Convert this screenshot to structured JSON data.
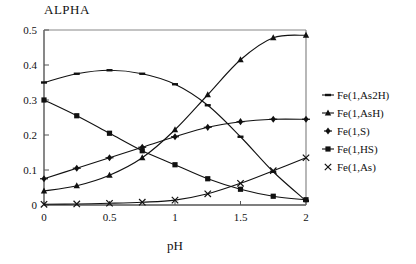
{
  "chart_data": {
    "type": "line",
    "title": "ALPHA",
    "xlabel": "pH",
    "ylabel": "",
    "xlim": [
      0,
      2
    ],
    "ylim": [
      0,
      0.5
    ],
    "xticks": [
      "0",
      "0.5",
      "1",
      "1.5",
      "2"
    ],
    "xtick_values": [
      0,
      0.5,
      1,
      1.5,
      2
    ],
    "yticks": [
      "0",
      "0.1",
      "0.2",
      "0.3",
      "0.4",
      "0.5"
    ],
    "ytick_values": [
      0,
      0.1,
      0.2,
      0.3,
      0.4,
      0.5
    ],
    "grid": false,
    "legend_position": "right",
    "x": [
      0,
      0.25,
      0.5,
      0.75,
      1.0,
      1.25,
      1.5,
      1.75,
      2.0
    ],
    "series": [
      {
        "name": "Fe(1,As2H)",
        "marker": "dash",
        "values": [
          0.35,
          0.375,
          0.385,
          0.375,
          0.345,
          0.285,
          0.195,
          0.095,
          0.012
        ]
      },
      {
        "name": "Fe(1,AsH)",
        "marker": "triangle",
        "values": [
          0.04,
          0.055,
          0.085,
          0.135,
          0.215,
          0.315,
          0.415,
          0.478,
          0.485
        ]
      },
      {
        "name": "Fe(1,S)",
        "marker": "diamond",
        "values": [
          0.075,
          0.105,
          0.135,
          0.165,
          0.195,
          0.222,
          0.238,
          0.245,
          0.245
        ]
      },
      {
        "name": "Fe(1,HS)",
        "marker": "square",
        "values": [
          0.3,
          0.255,
          0.205,
          0.155,
          0.115,
          0.075,
          0.045,
          0.025,
          0.015
        ]
      },
      {
        "name": "Fe(1,As)",
        "marker": "cross",
        "values": [
          0.002,
          0.003,
          0.005,
          0.008,
          0.014,
          0.032,
          0.062,
          0.098,
          0.135
        ]
      }
    ]
  },
  "legend": {
    "items": [
      {
        "label": "Fe(1,As2H)",
        "marker": "dash"
      },
      {
        "label": "Fe(1,AsH)",
        "marker": "triangle"
      },
      {
        "label": "Fe(1,S)",
        "marker": "diamond"
      },
      {
        "label": "Fe(1,HS)",
        "marker": "square"
      },
      {
        "label": "Fe(1,As)",
        "marker": "cross"
      }
    ]
  }
}
